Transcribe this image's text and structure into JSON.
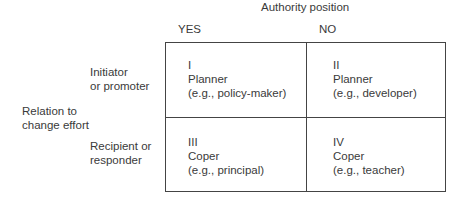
{
  "column_axis": {
    "title": "Authority position",
    "columns": [
      "YES",
      "NO"
    ]
  },
  "row_axis": {
    "title_line1": "Relation to",
    "title_line2": "change effort",
    "rows": [
      {
        "line1": "Initiator",
        "line2": "or promoter"
      },
      {
        "line1": "Recipient or",
        "line2": "responder"
      }
    ]
  },
  "cells": [
    {
      "numeral": "I",
      "role": "Planner",
      "example": "(e.g., policy-maker)"
    },
    {
      "numeral": "II",
      "role": "Planner",
      "example": "(e.g., developer)"
    },
    {
      "numeral": "III",
      "role": "Coper",
      "example": "(e.g., principal)"
    },
    {
      "numeral": "IV",
      "role": "Coper",
      "example": "(e.g., teacher)"
    }
  ]
}
